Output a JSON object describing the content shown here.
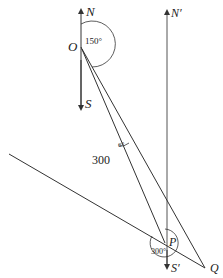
{
  "diagram": {
    "type": "bearing-geometry",
    "points": {
      "O": {
        "label": "O",
        "x": 81,
        "y": 47
      },
      "P": {
        "label": "P",
        "x": 165,
        "y": 243
      },
      "Q": {
        "label": "Q",
        "x": 205,
        "y": 268
      }
    },
    "compass_O": {
      "north_label": "N",
      "south_label": "S"
    },
    "compass_P": {
      "north_label": "N′",
      "south_label": "S′"
    },
    "angles": {
      "at_O": "150°",
      "at_O_between_OP_OQ": "6°",
      "at_P": "300°"
    },
    "lengths": {
      "OP": "300"
    },
    "colors": {
      "line": "#333333",
      "background": "#ffffff"
    }
  }
}
